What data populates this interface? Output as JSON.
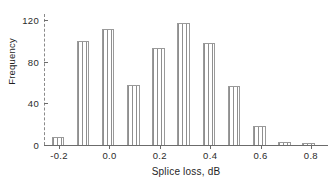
{
  "chart_data": {
    "type": "bar",
    "title": "",
    "subtitle": "",
    "xlabel": "Splice loss, dB",
    "ylabel": "Frequency",
    "xlim": [
      -0.26,
      0.86
    ],
    "ylim": [
      0,
      126
    ],
    "grid": false,
    "legend": null,
    "bin_width": 0.05,
    "xticks": [
      -0.2,
      0.0,
      0.2,
      0.4,
      0.6,
      0.8
    ],
    "xtick_labels": [
      "-0.2",
      "0.0",
      "0.2",
      "0.4",
      "0.6",
      "0.8"
    ],
    "yticks": [
      0,
      40,
      80,
      120
    ],
    "ytick_labels": [
      "0",
      "40",
      "80",
      "120"
    ],
    "categories": [
      -0.2,
      -0.1,
      0.0,
      0.1,
      0.2,
      0.3,
      0.4,
      0.5,
      0.6,
      0.7,
      0.8
    ],
    "values": [
      8,
      100,
      112,
      58,
      93,
      117,
      98,
      57,
      18,
      3,
      2
    ],
    "bars": [
      {
        "x": -0.205,
        "value": 8
      },
      {
        "x": -0.105,
        "value": 100
      },
      {
        "x": -0.005,
        "value": 112
      },
      {
        "x": 0.095,
        "value": 58
      },
      {
        "x": 0.195,
        "value": 93
      },
      {
        "x": 0.295,
        "value": 117
      },
      {
        "x": 0.395,
        "value": 98
      },
      {
        "x": 0.495,
        "value": 57
      },
      {
        "x": 0.595,
        "value": 18
      },
      {
        "x": 0.695,
        "value": 3
      },
      {
        "x": 0.79,
        "value": 2
      }
    ]
  }
}
